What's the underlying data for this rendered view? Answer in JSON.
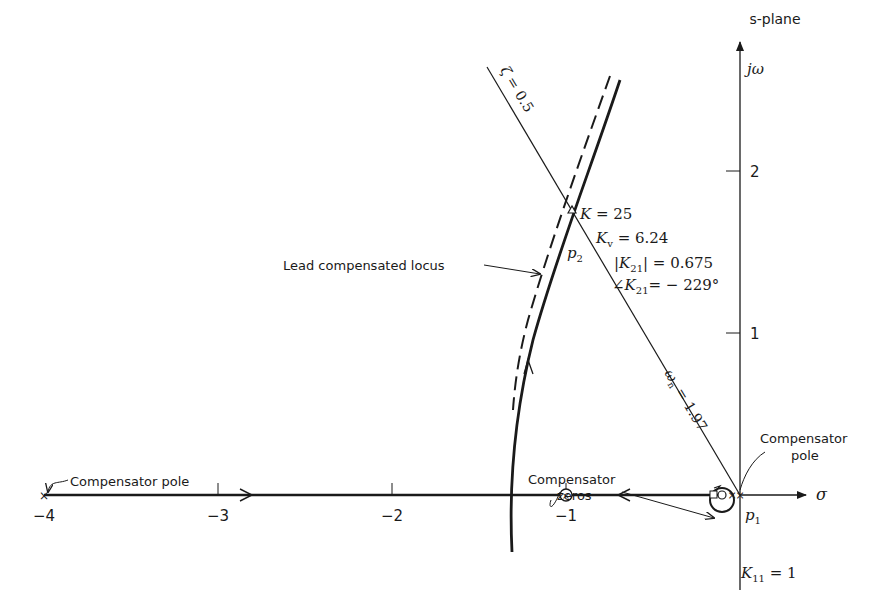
{
  "diagram": {
    "title": "s-plane",
    "axes": {
      "real_label": "σ",
      "imag_label": "jω",
      "x_ticks": [
        {
          "value": -4,
          "label": "−4"
        },
        {
          "value": -3,
          "label": "−3"
        },
        {
          "value": -2,
          "label": "−2"
        },
        {
          "value": -1,
          "label": "−1"
        }
      ],
      "y_ticks": [
        {
          "value": 1,
          "label": "1"
        },
        {
          "value": 2,
          "label": "2"
        }
      ]
    },
    "damping_line": {
      "label_zeta": "ζ",
      "label_rest": " = 0.5",
      "zeta": 0.5
    },
    "wn_line": {
      "label_wn": "ω",
      "label_sub": "n",
      "label_rest": " = 1.97",
      "wn": 1.97
    },
    "operating_point": {
      "point_label": "p",
      "point_sub": "2",
      "K": {
        "label": "K",
        "value": " = 25"
      },
      "Kv": {
        "label": "K",
        "sub": "v",
        "value": " = 6.24"
      },
      "K21_mag": {
        "pre": "|",
        "label": "K",
        "sub": "21",
        "value": "| = 0.675"
      },
      "K21_angle": {
        "pre": "∠",
        "label": "K",
        "sub": "21",
        "value": "= − 229°"
      }
    },
    "p1": {
      "label": "p",
      "sub": "1",
      "K11": {
        "label": "K",
        "sub": "11",
        "value": " = 1"
      }
    },
    "annotations": {
      "lead_locus": "Lead compensated locus",
      "comp_pole_left": "Compensator pole",
      "comp_zeros_line1": "Compensator",
      "comp_zeros_line2": "zeros",
      "comp_pole_right_line1": "Compensator",
      "comp_pole_right_line2": "pole"
    }
  }
}
